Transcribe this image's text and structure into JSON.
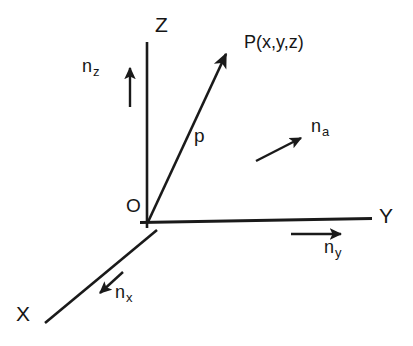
{
  "figure": {
    "background_color": "#ffffff",
    "stroke_color": "#1a1a1a"
  },
  "axes": {
    "x": {
      "label": "X",
      "label_x": 16,
      "label_y": 303
    },
    "y": {
      "label": "Y",
      "label_x": 379,
      "label_y": 205
    },
    "z": {
      "label": "Z",
      "label_x": 155,
      "label_y": 14
    }
  },
  "origin": {
    "label": "O",
    "label_x": 126,
    "label_y": 196,
    "point_x": 148,
    "point_y": 222
  },
  "point": {
    "label": "P(x,y,z)",
    "label_x": 244,
    "label_y": 33
  },
  "vectors": [
    {
      "id": "p",
      "label": "p",
      "subscript": "",
      "label_x": 194,
      "label_y": 126,
      "description": "position vector from origin O to point P"
    },
    {
      "id": "n_z",
      "label": "n",
      "subscript": "z",
      "label_x": 82,
      "label_y": 57,
      "description": "unit vector along Z axis"
    },
    {
      "id": "n_a",
      "label": "n",
      "subscript": "a",
      "label_x": 311,
      "label_y": 117,
      "description": "arbitrary unit vector"
    },
    {
      "id": "n_y",
      "label": "n",
      "subscript": "y",
      "label_x": 324,
      "label_y": 238,
      "description": "unit vector along Y axis"
    },
    {
      "id": "n_x",
      "label": "n",
      "subscript": "x",
      "label_x": 115,
      "label_y": 283,
      "description": "unit vector along X axis"
    }
  ],
  "geometry": {
    "z_axis": {
      "x1": 147,
      "y1": 42,
      "x2": 147,
      "y2": 228
    },
    "y_axis": {
      "x1": 141,
      "y1": 222,
      "x2": 372,
      "y2": 218
    },
    "x_axis": {
      "x1": 155,
      "y1": 228,
      "x2": 45,
      "y2": 323
    },
    "p_vector": {
      "x1": 148,
      "y1": 222,
      "x2": 228,
      "y2": 50
    },
    "n_z_arrow": {
      "x1": 130,
      "y1": 107,
      "x2": 130,
      "y2": 64
    },
    "n_a_arrow": {
      "x1": 256,
      "y1": 161,
      "x2": 304,
      "y2": 136
    },
    "n_y_arrow": {
      "x1": 291,
      "y1": 234,
      "x2": 345,
      "y2": 234
    },
    "n_x_arrow": {
      "x1": 123,
      "y1": 272,
      "x2": 97,
      "y2": 296
    }
  }
}
